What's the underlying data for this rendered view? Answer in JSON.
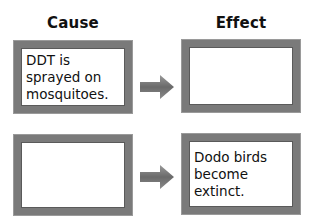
{
  "headers": {
    "cause": "Cause",
    "effect": "Effect"
  },
  "rows": [
    {
      "cause": "DDT is sprayed on mosquitoes.",
      "effect": ""
    },
    {
      "cause": "",
      "effect": "Dodo birds become extinct."
    }
  ],
  "colors": {
    "border": "#7a7a7a",
    "arrow": "#6f6f6f",
    "text": "#111111"
  }
}
